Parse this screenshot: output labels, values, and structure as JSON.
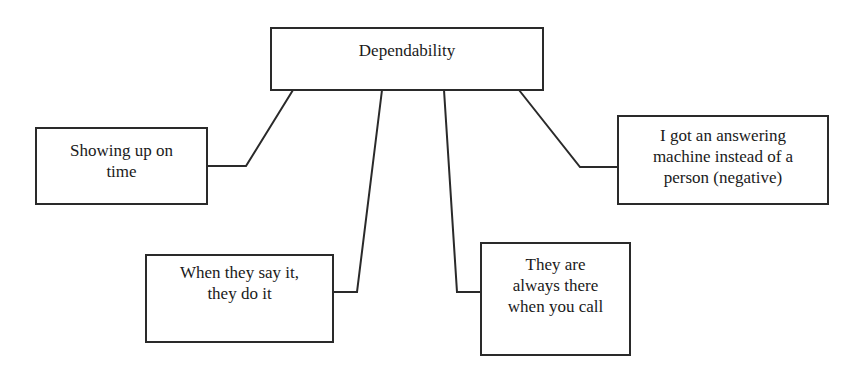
{
  "diagram": {
    "type": "concept-map",
    "line_color": "#2a2a2a",
    "root": {
      "label": "Dependability"
    },
    "children": [
      {
        "label": "Showing up on\ntime"
      },
      {
        "label": "When they say it,\nthey do it"
      },
      {
        "label": "They are\nalways there\nwhen  you call"
      },
      {
        "label": "I got an answering\nmachine instead of a\nperson (negative)"
      }
    ],
    "edges": [
      {
        "from": "Dependability",
        "to": "Showing up on time"
      },
      {
        "from": "Dependability",
        "to": "When they say it, they do it"
      },
      {
        "from": "Dependability",
        "to": "They are always there when you call"
      },
      {
        "from": "Dependability",
        "to": "I got an answering machine instead of a person (negative)"
      }
    ]
  }
}
